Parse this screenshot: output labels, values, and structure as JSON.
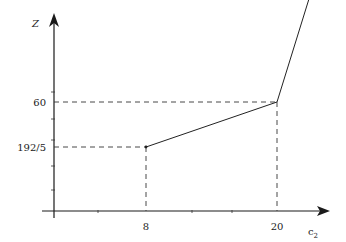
{
  "chart_data": {
    "type": "line",
    "title": "",
    "xlabel": "c",
    "xlabel_subscript": "2",
    "ylabel": "Z",
    "x_ticks": [
      {
        "value": 8,
        "label": "8"
      },
      {
        "value": 20,
        "label": "20"
      }
    ],
    "y_ticks": [
      {
        "value": 38.4,
        "label": "192/5"
      },
      {
        "value": 60,
        "label": "60"
      }
    ],
    "series": [
      {
        "name": "Z(c2)",
        "points": [
          {
            "x": 8,
            "y": 38.4
          },
          {
            "x": 20,
            "y": 60
          },
          {
            "x": 24.5,
            "y": 136
          }
        ]
      }
    ],
    "guides": [
      {
        "x": 8,
        "y": 38.4
      },
      {
        "x": 20,
        "y": 60
      }
    ],
    "start_point": {
      "x": 8,
      "y": 38.4
    },
    "grid": false,
    "legend": "none"
  }
}
